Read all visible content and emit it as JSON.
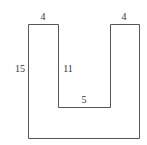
{
  "diagram": {
    "type": "u-shape",
    "labels": {
      "top_left_width": "4",
      "top_right_width": "4",
      "outer_height": "15",
      "inner_height": "11",
      "inner_bottom_width": "5"
    },
    "stroke_color": "#555555"
  }
}
